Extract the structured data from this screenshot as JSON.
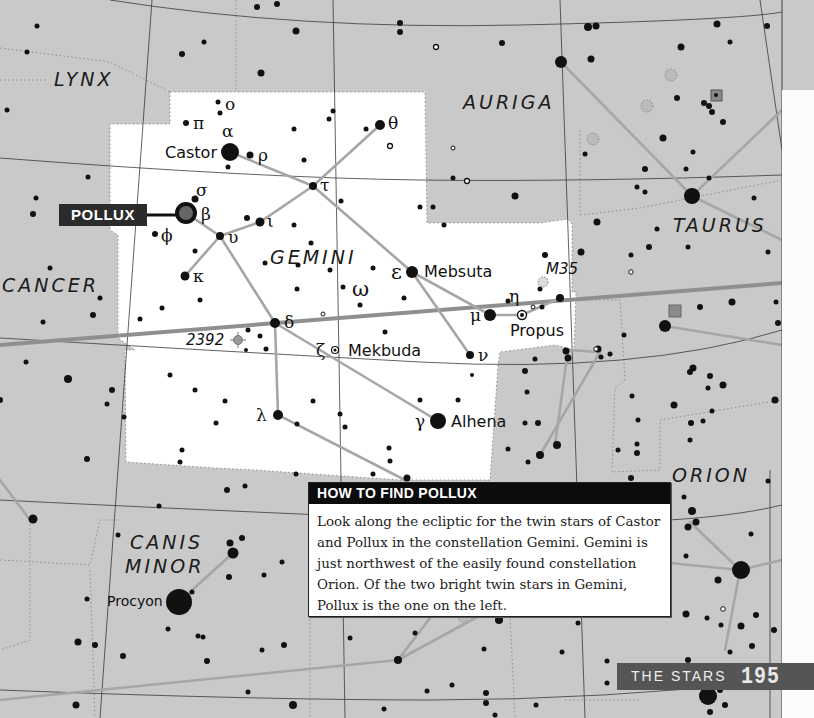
{
  "page": {
    "section_label": "THE STARS",
    "page_number": "195"
  },
  "colors": {
    "map_background": "#c9c9c9",
    "gemini_region": "#ffffff",
    "stick_lines": "#a6a6a6",
    "ecliptic": "#8f8f8f",
    "star": "#111111",
    "callout_bg": "#2b2b2b",
    "footer_bg": "#555555"
  },
  "constellations": {
    "lynx": "LYNX",
    "auriga": "AURIGA",
    "taurus": "TAURUS",
    "cancer": "CANCER",
    "gemini": "GEMINI",
    "orion": "ORION",
    "canis_minor_line1": "CANIS",
    "canis_minor_line2": "MINOR"
  },
  "callout": {
    "label": "POLLUX"
  },
  "star_names": {
    "castor": "Castor",
    "mebsuta": "Mebsuta",
    "propus": "Propus",
    "mekbuda": "Mekbuda",
    "alhena": "Alhena",
    "procyon": "Procyon"
  },
  "greek_letters": {
    "omicron": "ο",
    "pi": "π",
    "alpha": "α",
    "rho": "ρ",
    "theta": "θ",
    "tau": "τ",
    "sigma": "σ",
    "beta": "β",
    "phi": "ϕ",
    "upsilon": "υ",
    "iota": "ι",
    "kappa": "κ",
    "epsilon": "ε",
    "omega": "ω",
    "eta": "η",
    "mu": "μ",
    "delta": "δ",
    "zeta": "ζ",
    "nu": "ν",
    "lambda": "λ",
    "gamma": "γ"
  },
  "deep_sky": {
    "m35": "M35",
    "ngc2392": "2392"
  },
  "infobox": {
    "title": "HOW TO FIND POLLUX",
    "body": "Look along the ecliptic for the twin stars of Castor and Pollux in the constellation Gemini. Gemini is just northwest of the easily found constellation Orion. Of the two bright twin stars in Gemini, Pollux is the one on the left."
  }
}
